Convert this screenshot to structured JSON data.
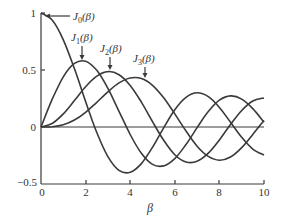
{
  "chart_data": {
    "type": "line",
    "title": "",
    "xlabel": "β",
    "ylabel": "",
    "xlim": [
      0,
      10
    ],
    "ylim": [
      -0.5,
      1
    ],
    "grid": false,
    "x_ticks": [
      "0",
      "2",
      "4",
      "6",
      "8",
      "10"
    ],
    "y_ticks": [
      "1",
      "0.5",
      "0",
      "−0.5"
    ],
    "x": [
      0,
      0.5,
      1,
      1.5,
      2,
      2.5,
      3,
      3.5,
      4,
      4.5,
      5,
      5.5,
      6,
      6.5,
      7,
      7.5,
      8,
      8.5,
      9,
      9.5,
      10
    ],
    "series": [
      {
        "name": "J0(β)",
        "values": [
          1.0,
          0.938,
          0.765,
          0.512,
          0.224,
          -0.048,
          -0.26,
          -0.38,
          -0.397,
          -0.321,
          -0.178,
          -0.007,
          0.151,
          0.26,
          0.3,
          0.266,
          0.172,
          0.042,
          -0.09,
          -0.194,
          -0.246
        ]
      },
      {
        "name": "J1(β)",
        "values": [
          0.0,
          0.242,
          0.44,
          0.558,
          0.577,
          0.497,
          0.339,
          0.137,
          -0.066,
          -0.231,
          -0.328,
          -0.341,
          -0.277,
          -0.154,
          -0.005,
          0.135,
          0.235,
          0.273,
          0.245,
          0.161,
          0.043
        ]
      },
      {
        "name": "J2(β)",
        "values": [
          0.0,
          0.031,
          0.115,
          0.232,
          0.353,
          0.446,
          0.486,
          0.459,
          0.364,
          0.218,
          0.047,
          -0.117,
          -0.243,
          -0.307,
          -0.301,
          -0.23,
          -0.113,
          0.022,
          0.145,
          0.228,
          0.255
        ]
      },
      {
        "name": "J3(β)",
        "values": [
          0.0,
          0.003,
          0.02,
          0.061,
          0.129,
          0.217,
          0.309,
          0.387,
          0.43,
          0.425,
          0.365,
          0.256,
          0.115,
          -0.035,
          -0.168,
          -0.258,
          -0.291,
          -0.263,
          -0.181,
          -0.065,
          0.058
        ]
      }
    ],
    "annotations": [
      {
        "text": "J0(β)",
        "arrow_to_x": 0.15,
        "arrow_to_y": 1.0
      },
      {
        "text": "J1(β)",
        "arrow_to_x": 1.84,
        "arrow_to_y": 0.582
      },
      {
        "text": "J2(β)",
        "arrow_to_x": 3.05,
        "arrow_to_y": 0.486
      },
      {
        "text": "J3(β)",
        "arrow_to_x": 4.2,
        "arrow_to_y": 0.434
      }
    ]
  },
  "labels": {
    "xlabel": "β",
    "y_1": "1",
    "y_05": "0.5",
    "y_0": "0",
    "y_m05": "−0.5",
    "x_0": "0",
    "x_2": "2",
    "x_4": "4",
    "x_6": "6",
    "x_8": "8",
    "x_10": "10",
    "j0_main": "J",
    "j0_sub": "0",
    "j0_arg": "(β)",
    "j1_main": "J",
    "j1_sub": "1",
    "j1_arg": "(β)",
    "j2_main": "J",
    "j2_sub": "2",
    "j2_arg": "(β)",
    "j3_main": "J",
    "j3_sub": "3",
    "j3_arg": "(β)"
  }
}
